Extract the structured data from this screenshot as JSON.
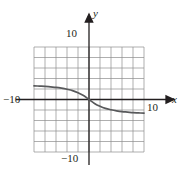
{
  "figure": {
    "name": "cartesian-graph",
    "background_color": "#ffffff",
    "grid_color": "#8c8c8c",
    "axis_color": "#231f20",
    "curve_color": "#58595b"
  },
  "labels": {
    "x_axis": "x",
    "y_axis": "y",
    "y_top": "10",
    "y_bottom": "−10",
    "x_left": "−10",
    "x_right": "10"
  },
  "chart_data": {
    "type": "line",
    "title": "",
    "xlabel": "x",
    "ylabel": "y",
    "xlim": [
      -10,
      10
    ],
    "ylim": [
      -10,
      10
    ],
    "grid": true,
    "grid_step": 2,
    "legend": "none",
    "xticks": [
      -10,
      10
    ],
    "yticks": [
      -10,
      10
    ],
    "series": [
      {
        "name": "curve",
        "x": [
          -10,
          -9,
          -8,
          -7,
          -6,
          -5,
          -4,
          -3,
          -2,
          -1,
          0,
          1,
          2,
          3,
          4,
          5,
          6,
          7,
          8,
          9,
          10
        ],
        "y": [
          2.6,
          2.55,
          2.5,
          2.4,
          2.3,
          2.15,
          1.95,
          1.7,
          1.3,
          0.75,
          0.0,
          -0.75,
          -1.3,
          -1.7,
          -1.95,
          -2.15,
          -2.3,
          -2.4,
          -2.5,
          -2.55,
          -2.6
        ]
      }
    ]
  }
}
